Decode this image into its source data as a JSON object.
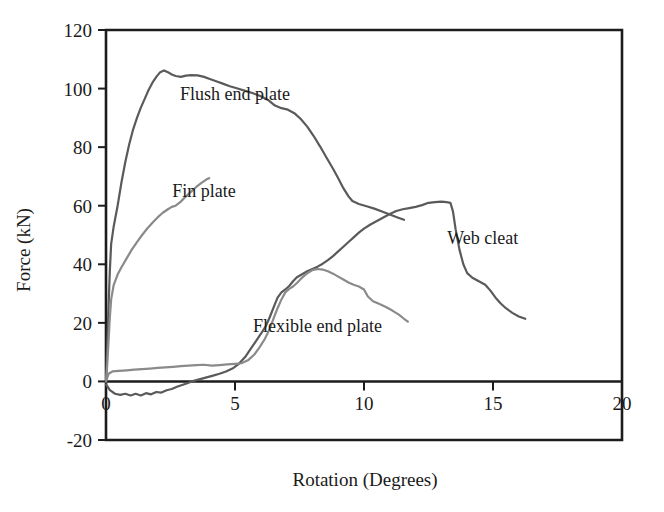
{
  "chart_data": {
    "type": "line",
    "title": "",
    "xlabel": "Rotation (Degrees)",
    "ylabel": "Force (kN)",
    "xlim": [
      0,
      20
    ],
    "ylim": [
      -20,
      120
    ],
    "xticks": [
      "0",
      "5",
      "10",
      "15",
      "20"
    ],
    "xtick_values": [
      0,
      5,
      10,
      15,
      20
    ],
    "yticks": [
      "-20",
      "0",
      "20",
      "40",
      "60",
      "80",
      "100",
      "120"
    ],
    "ytick_values": [
      -20,
      0,
      20,
      40,
      60,
      80,
      100,
      120
    ],
    "grid": false,
    "legend_position": "inline-annotations",
    "series": [
      {
        "name": "Flush end plate",
        "color": "#5a5a5a",
        "label_x": 5.0,
        "label_y": 96.0,
        "points": [
          [
            0.0,
            0.0
          ],
          [
            0.05,
            12.0
          ],
          [
            0.1,
            26.0
          ],
          [
            0.15,
            38.0
          ],
          [
            0.2,
            47.0
          ],
          [
            0.3,
            53.0
          ],
          [
            0.45,
            60.0
          ],
          [
            0.6,
            68.0
          ],
          [
            0.75,
            75.0
          ],
          [
            0.9,
            81.0
          ],
          [
            1.05,
            86.0
          ],
          [
            1.2,
            90.0
          ],
          [
            1.35,
            93.5
          ],
          [
            1.5,
            96.5
          ],
          [
            1.65,
            99.5
          ],
          [
            1.8,
            102.0
          ],
          [
            1.95,
            104.0
          ],
          [
            2.1,
            105.6
          ],
          [
            2.25,
            106.2
          ],
          [
            2.4,
            105.6
          ],
          [
            2.55,
            104.8
          ],
          [
            2.7,
            104.3
          ],
          [
            2.9,
            104.0
          ],
          [
            3.1,
            104.4
          ],
          [
            3.3,
            104.6
          ],
          [
            3.55,
            104.5
          ],
          [
            3.8,
            104.0
          ],
          [
            4.05,
            103.2
          ],
          [
            4.3,
            102.4
          ],
          [
            4.55,
            101.6
          ],
          [
            4.8,
            100.8
          ],
          [
            5.1,
            100.0
          ],
          [
            5.4,
            99.2
          ],
          [
            5.7,
            98.4
          ],
          [
            6.0,
            97.4
          ],
          [
            6.3,
            96.0
          ],
          [
            6.55,
            94.2
          ],
          [
            6.8,
            93.3
          ],
          [
            7.05,
            92.8
          ],
          [
            7.3,
            91.6
          ],
          [
            7.55,
            89.6
          ],
          [
            7.8,
            87.0
          ],
          [
            8.05,
            83.8
          ],
          [
            8.3,
            80.2
          ],
          [
            8.55,
            76.4
          ],
          [
            8.8,
            72.6
          ],
          [
            9.0,
            69.4
          ],
          [
            9.2,
            66.0
          ],
          [
            9.4,
            63.2
          ],
          [
            9.55,
            61.6
          ],
          [
            9.8,
            60.6
          ],
          [
            10.1,
            59.8
          ],
          [
            10.4,
            59.0
          ],
          [
            10.7,
            58.0
          ],
          [
            11.0,
            57.0
          ],
          [
            11.3,
            56.0
          ],
          [
            11.55,
            55.2
          ]
        ]
      },
      {
        "name": "Fin plate",
        "color": "#8a8a8a",
        "label_x": 3.8,
        "label_y": 63.0,
        "points": [
          [
            0.0,
            0.0
          ],
          [
            0.05,
            6.0
          ],
          [
            0.1,
            14.0
          ],
          [
            0.15,
            22.0
          ],
          [
            0.2,
            28.0
          ],
          [
            0.3,
            33.0
          ],
          [
            0.45,
            36.5
          ],
          [
            0.6,
            39.0
          ],
          [
            0.8,
            42.0
          ],
          [
            1.0,
            45.0
          ],
          [
            1.2,
            47.6
          ],
          [
            1.4,
            50.0
          ],
          [
            1.6,
            52.2
          ],
          [
            1.8,
            54.2
          ],
          [
            2.0,
            56.0
          ],
          [
            2.2,
            57.6
          ],
          [
            2.4,
            58.8
          ],
          [
            2.55,
            59.6
          ],
          [
            2.7,
            60.0
          ],
          [
            2.9,
            61.4
          ],
          [
            3.1,
            63.2
          ],
          [
            3.3,
            64.8
          ],
          [
            3.5,
            66.4
          ],
          [
            3.7,
            67.8
          ],
          [
            3.9,
            69.0
          ],
          [
            4.0,
            69.4
          ]
        ]
      },
      {
        "name": "Web cleat",
        "color": "#5a5a5a",
        "label_x": 14.6,
        "label_y": 47.0,
        "points": [
          [
            0.0,
            -1.0
          ],
          [
            0.15,
            -3.0
          ],
          [
            0.35,
            -4.2
          ],
          [
            0.55,
            -4.6
          ],
          [
            0.75,
            -4.2
          ],
          [
            0.95,
            -4.8
          ],
          [
            1.15,
            -4.2
          ],
          [
            1.35,
            -4.8
          ],
          [
            1.55,
            -4.0
          ],
          [
            1.75,
            -4.4
          ],
          [
            1.95,
            -3.6
          ],
          [
            2.15,
            -3.8
          ],
          [
            2.35,
            -3.0
          ],
          [
            2.55,
            -2.6
          ],
          [
            2.75,
            -1.8
          ],
          [
            2.95,
            -1.2
          ],
          [
            3.15,
            -0.6
          ],
          [
            3.4,
            0.2
          ],
          [
            3.65,
            0.8
          ],
          [
            3.9,
            1.4
          ],
          [
            4.15,
            2.0
          ],
          [
            4.4,
            2.6
          ],
          [
            4.65,
            3.4
          ],
          [
            4.9,
            4.4
          ],
          [
            5.15,
            6.0
          ],
          [
            5.4,
            8.4
          ],
          [
            5.6,
            11.0
          ],
          [
            5.8,
            13.6
          ],
          [
            6.0,
            16.2
          ],
          [
            6.2,
            19.0
          ],
          [
            6.35,
            22.0
          ],
          [
            6.5,
            25.4
          ],
          [
            6.65,
            28.6
          ],
          [
            6.8,
            30.4
          ],
          [
            6.95,
            31.4
          ],
          [
            7.1,
            32.6
          ],
          [
            7.25,
            34.2
          ],
          [
            7.4,
            35.6
          ],
          [
            7.6,
            36.6
          ],
          [
            7.8,
            37.6
          ],
          [
            8.0,
            38.4
          ],
          [
            8.2,
            39.2
          ],
          [
            8.4,
            40.2
          ],
          [
            8.6,
            41.4
          ],
          [
            8.8,
            42.8
          ],
          [
            9.0,
            44.4
          ],
          [
            9.2,
            46.0
          ],
          [
            9.4,
            47.6
          ],
          [
            9.6,
            49.2
          ],
          [
            9.8,
            50.8
          ],
          [
            10.0,
            52.2
          ],
          [
            10.25,
            53.6
          ],
          [
            10.5,
            54.8
          ],
          [
            10.75,
            56.0
          ],
          [
            11.0,
            57.2
          ],
          [
            11.25,
            58.2
          ],
          [
            11.5,
            58.8
          ],
          [
            11.75,
            59.2
          ],
          [
            12.0,
            59.6
          ],
          [
            12.25,
            60.2
          ],
          [
            12.5,
            61.0
          ],
          [
            12.75,
            61.2
          ],
          [
            13.0,
            61.4
          ],
          [
            13.2,
            61.2
          ],
          [
            13.35,
            61.0
          ],
          [
            13.45,
            58.0
          ],
          [
            13.55,
            52.0
          ],
          [
            13.7,
            45.0
          ],
          [
            13.85,
            40.0
          ],
          [
            14.0,
            37.0
          ],
          [
            14.2,
            35.4
          ],
          [
            14.45,
            34.2
          ],
          [
            14.7,
            33.0
          ],
          [
            14.9,
            31.0
          ],
          [
            15.1,
            28.6
          ],
          [
            15.3,
            26.6
          ],
          [
            15.5,
            25.0
          ],
          [
            15.75,
            23.4
          ],
          [
            16.0,
            22.2
          ],
          [
            16.25,
            21.4
          ]
        ]
      },
      {
        "name": "Flexible end plate",
        "color": "#8a8a8a",
        "label_x": 8.2,
        "label_y": 17.0,
        "points": [
          [
            0.0,
            0.0
          ],
          [
            0.1,
            2.6
          ],
          [
            0.25,
            3.4
          ],
          [
            0.5,
            3.6
          ],
          [
            0.8,
            3.8
          ],
          [
            1.1,
            4.0
          ],
          [
            1.4,
            4.2
          ],
          [
            1.7,
            4.4
          ],
          [
            2.0,
            4.6
          ],
          [
            2.3,
            4.8
          ],
          [
            2.6,
            5.0
          ],
          [
            2.9,
            5.2
          ],
          [
            3.2,
            5.4
          ],
          [
            3.5,
            5.6
          ],
          [
            3.8,
            5.7
          ],
          [
            4.1,
            5.4
          ],
          [
            4.4,
            5.6
          ],
          [
            4.7,
            5.8
          ],
          [
            5.0,
            6.0
          ],
          [
            5.25,
            6.2
          ],
          [
            5.5,
            7.2
          ],
          [
            5.75,
            9.2
          ],
          [
            5.95,
            11.6
          ],
          [
            6.15,
            14.4
          ],
          [
            6.35,
            18.0
          ],
          [
            6.5,
            21.6
          ],
          [
            6.65,
            25.0
          ],
          [
            6.8,
            28.0
          ],
          [
            6.95,
            30.4
          ],
          [
            7.1,
            31.6
          ],
          [
            7.25,
            32.4
          ],
          [
            7.4,
            33.6
          ],
          [
            7.55,
            35.0
          ],
          [
            7.7,
            36.2
          ],
          [
            7.85,
            37.2
          ],
          [
            8.0,
            38.0
          ],
          [
            8.2,
            38.4
          ],
          [
            8.4,
            38.2
          ],
          [
            8.6,
            37.6
          ],
          [
            8.8,
            36.8
          ],
          [
            9.0,
            35.8
          ],
          [
            9.2,
            34.8
          ],
          [
            9.4,
            33.8
          ],
          [
            9.6,
            33.0
          ],
          [
            9.8,
            32.4
          ],
          [
            10.0,
            31.4
          ],
          [
            10.15,
            29.0
          ],
          [
            10.35,
            27.4
          ],
          [
            10.6,
            26.4
          ],
          [
            10.85,
            25.4
          ],
          [
            11.1,
            24.2
          ],
          [
            11.35,
            22.8
          ],
          [
            11.55,
            21.4
          ],
          [
            11.7,
            20.4
          ]
        ]
      }
    ]
  },
  "axis": {
    "x_title": "Rotation (Degrees)",
    "y_title": "Force (kN)"
  }
}
